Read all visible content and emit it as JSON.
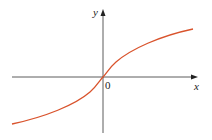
{
  "diagram": {
    "type": "function-graph",
    "x_label": "x",
    "y_label": "y",
    "origin_label": "0",
    "curve_color": "#d9532c",
    "axis_color": "#333333"
  }
}
